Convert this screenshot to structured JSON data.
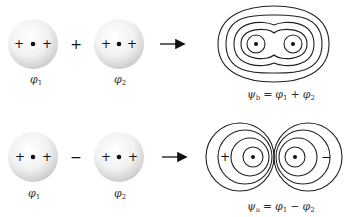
{
  "diagram": {
    "type": "molecular-orbital-combination",
    "rows": [
      {
        "id": "bonding",
        "operator": "+",
        "atom1": {
          "label": "φ",
          "subscript": "1",
          "signs": [
            "+",
            "+"
          ]
        },
        "atom2": {
          "label": "φ",
          "subscript": "2",
          "signs": [
            "+",
            "+"
          ]
        },
        "arrow": "→",
        "result": {
          "description": "bonding orbital contour map enclosing both nuclei",
          "psi": "ψ",
          "psi_sub": "b",
          "equals": "=",
          "term1": "φ",
          "term1_sub": "1",
          "op": "+",
          "term2": "φ",
          "term2_sub": "2"
        }
      },
      {
        "id": "antibonding",
        "operator": "−",
        "atom1": {
          "label": "φ",
          "subscript": "1",
          "signs": [
            "+",
            "+"
          ]
        },
        "atom2": {
          "label": "φ",
          "subscript": "2",
          "signs": [
            "+",
            "+"
          ]
        },
        "arrow": "→",
        "result": {
          "description": "antibonding orbital contour map with node between nuclei",
          "lobe_left_sign": "+",
          "lobe_right_sign": "−",
          "psi": "ψ",
          "psi_sub": "a",
          "equals": "=",
          "term1": "φ",
          "term1_sub": "1",
          "op": "−",
          "term2": "φ",
          "term2_sub": "2"
        }
      }
    ],
    "colors": {
      "contour": "#222222",
      "sphere_highlight": "#ffffff",
      "sphere_shade": "#bdbdbd",
      "text": "#333333"
    }
  }
}
